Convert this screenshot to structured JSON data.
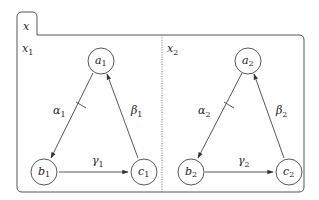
{
  "diagram": {
    "outer_label": "x",
    "colors": {
      "stroke": "#444444",
      "text": "#222222",
      "background": "#ffffff"
    },
    "panels": [
      {
        "label": "x",
        "label_sub": "1",
        "nodes": [
          {
            "id": "a1",
            "label": "a",
            "sub": "1"
          },
          {
            "id": "b1",
            "label": "b",
            "sub": "1"
          },
          {
            "id": "c1",
            "label": "c",
            "sub": "1"
          }
        ],
        "edges": [
          {
            "from": "a1",
            "to": "b1",
            "label": "α",
            "sub": "1",
            "tick": true
          },
          {
            "from": "b1",
            "to": "c1",
            "label": "γ",
            "sub": "1",
            "tick": false
          },
          {
            "from": "c1",
            "to": "a1",
            "label": "β",
            "sub": "1",
            "tick": false
          }
        ]
      },
      {
        "label": "x",
        "label_sub": "2",
        "nodes": [
          {
            "id": "a2",
            "label": "a",
            "sub": "2"
          },
          {
            "id": "b2",
            "label": "b",
            "sub": "2"
          },
          {
            "id": "c2",
            "label": "c",
            "sub": "2"
          }
        ],
        "edges": [
          {
            "from": "a2",
            "to": "b2",
            "label": "α",
            "sub": "2",
            "tick": true
          },
          {
            "from": "b2",
            "to": "c2",
            "label": "γ",
            "sub": "2",
            "tick": false
          },
          {
            "from": "c2",
            "to": "a2",
            "label": "β",
            "sub": "2",
            "tick": false
          }
        ]
      }
    ]
  }
}
